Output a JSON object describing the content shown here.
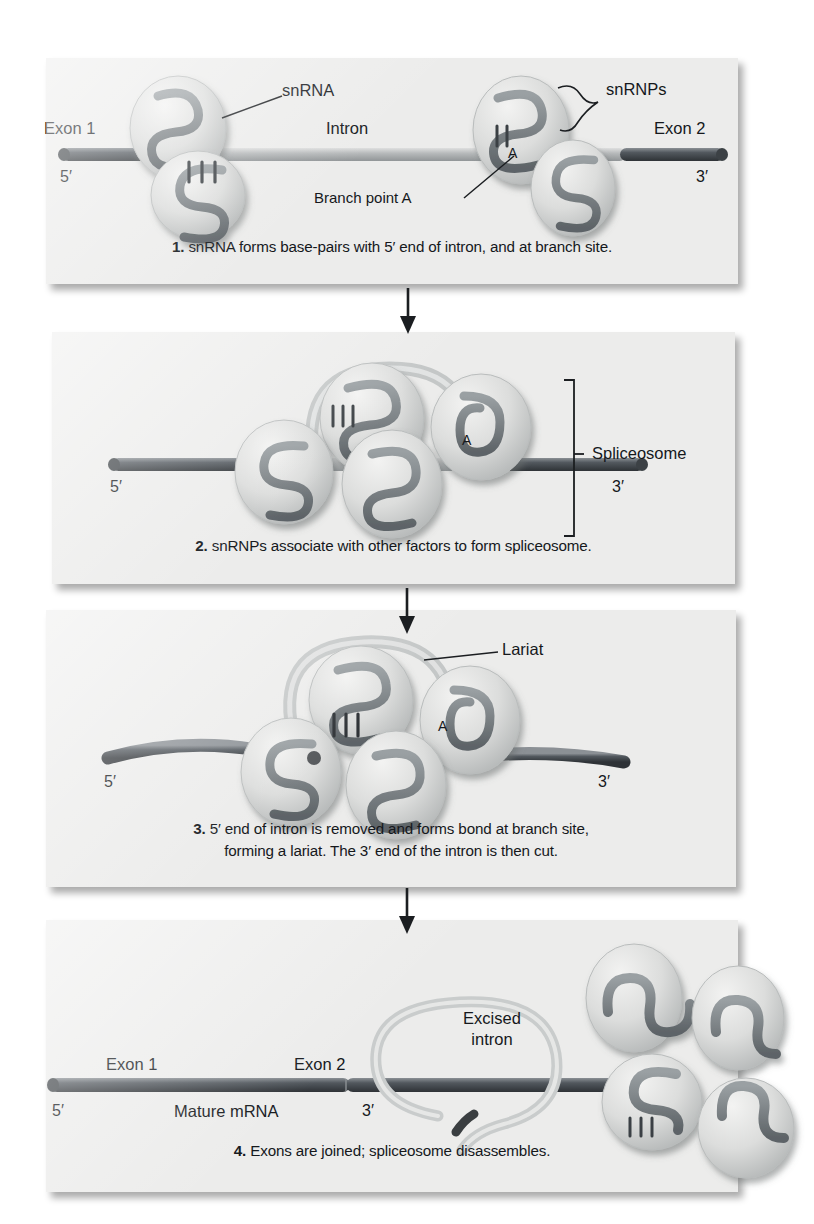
{
  "figure": {
    "background": "#ffffff",
    "panel_background": "#ececeb",
    "strand_dark": "#4a4f55",
    "strand_light": "#b9bcbd",
    "snrnp_fill": "#d9dada",
    "snrnp_squiggle": "#6f7477",
    "text_color": "#15181c"
  },
  "panels": [
    {
      "number": "1",
      "caption_prefix": "1.",
      "caption": "snRNA forms base-pairs with 5′ end of intron, and at branch site.",
      "labels": {
        "exon1": "Exon 1",
        "exon2": "Exon 2",
        "intron": "Intron",
        "snrna": "snRNA",
        "snrnps": "snRNPs",
        "branch_point": "Branch point A",
        "branch_letter": "A",
        "five_prime": "5′",
        "three_prime": "3′"
      }
    },
    {
      "number": "2",
      "caption_prefix": "2.",
      "caption": "snRNPs associate with other factors to form spliceosome.",
      "labels": {
        "spliceosome": "Spliceosome",
        "branch_letter": "A",
        "five_prime": "5′",
        "three_prime": "3′"
      }
    },
    {
      "number": "3",
      "caption_prefix": "3.",
      "caption_line1": "5′ end of intron is removed and forms bond at branch site,",
      "caption_line2": "forming a lariat. The 3′ end of the intron is then cut.",
      "labels": {
        "lariat": "Lariat",
        "branch_letter": "A",
        "five_prime": "5′",
        "three_prime": "3′"
      }
    },
    {
      "number": "4",
      "caption_prefix": "4.",
      "caption": "Exons are joined; spliceosome disassembles.",
      "labels": {
        "exon1": "Exon 1",
        "exon2": "Exon 2",
        "mature_mrna": "Mature mRNA",
        "excised_intron_line1": "Excised",
        "excised_intron_line2": "intron",
        "five_prime": "5′",
        "three_prime": "3′"
      }
    }
  ]
}
